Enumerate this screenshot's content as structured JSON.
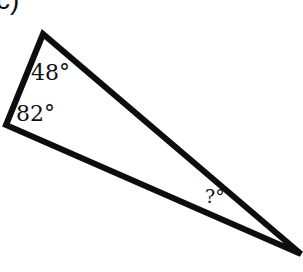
{
  "problem": {
    "label_fragment": "c)"
  },
  "triangle": {
    "stroke_color": "#0d0d0d",
    "stroke_width": 6,
    "vertices": {
      "top": [
        43,
        34
      ],
      "left": [
        6,
        125
      ],
      "right": [
        301,
        254
      ]
    },
    "angles": {
      "top": "48°",
      "left": "82°",
      "right": "?°"
    }
  }
}
